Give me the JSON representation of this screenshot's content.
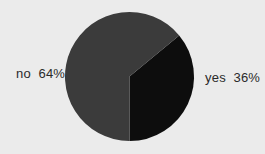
{
  "chart_data": {
    "type": "pie",
    "title": "",
    "categories": [
      "yes",
      "no"
    ],
    "values": [
      36,
      64
    ],
    "unit": "%",
    "labels": [
      "yes  36%",
      "no  64%"
    ],
    "colors": [
      "#0d0d0d",
      "#3b3b3b"
    ],
    "start_angle_deg": -90,
    "direction": "counterclockwise",
    "legend": "none",
    "grid": false
  },
  "labels": {
    "no": "no  64%",
    "yes": "yes  36%"
  },
  "background": "#ebebeb"
}
